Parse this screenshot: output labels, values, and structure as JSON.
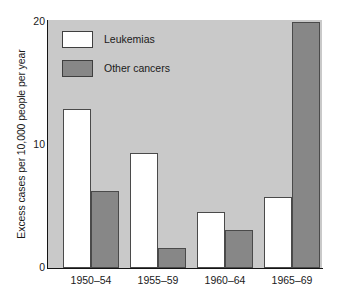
{
  "chart_data": {
    "type": "bar",
    "title": "",
    "subtitle": "",
    "xlabel": "",
    "ylabel": "Excess cases per 10,000 people per year",
    "categories": [
      "1950–54",
      "1955–59",
      "1960–64",
      "1965–69"
    ],
    "series": [
      {
        "name": "Leukemias",
        "values": [
          12.8,
          9.3,
          4.5,
          5.7
        ],
        "color": "#ffffff"
      },
      {
        "name": "Other cancers",
        "values": [
          6.2,
          1.6,
          3.1,
          19.8
        ],
        "color": "#878787"
      }
    ],
    "ylim": [
      0,
      20
    ],
    "yticks": [
      0,
      10,
      20
    ],
    "ytick_labels": [
      "0",
      "10",
      "20"
    ],
    "grid": false,
    "legend_position": "top-left",
    "panel_background": "#c9c9c9",
    "axis_color": "#141414",
    "bar_edge_color": "#4a4a4a"
  },
  "legend": {
    "items": [
      {
        "label": "Leukemias",
        "swatch": "white-swatch"
      },
      {
        "label": "Other cancers",
        "swatch": "gray-swatch"
      }
    ]
  },
  "axes": {
    "y_title": "Excess cases per 10,000 people per year",
    "y_ticks": [
      "20",
      "10",
      "0"
    ],
    "x_ticks": [
      "1950–54",
      "1955–59",
      "1960–64",
      "1965–69"
    ]
  }
}
